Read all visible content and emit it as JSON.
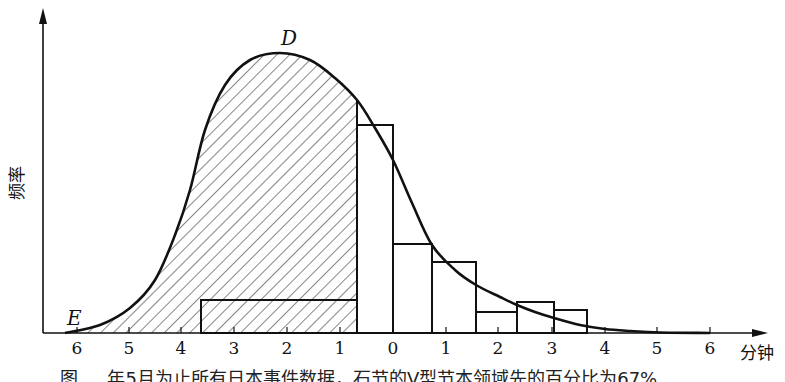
{
  "chart_data": {
    "type": "area",
    "title": "",
    "xlabel": "分钟",
    "ylabel": "频率",
    "x_tick_labels": [
      "6",
      "5",
      "4",
      "3",
      "2",
      "1",
      "0",
      "1",
      "2",
      "3",
      "4",
      "5",
      "6"
    ],
    "x_tick_px": [
      77,
      129,
      181,
      234,
      287,
      340,
      393,
      446,
      498,
      552,
      605,
      657,
      710
    ],
    "point_labels": [
      {
        "name": "D",
        "x": 288,
        "y": 46
      },
      {
        "name": "E",
        "x": 70,
        "y": 325
      }
    ],
    "curve": {
      "description": "right-skewed frequency curve, peak at D, tail to E on the left",
      "points_px": [
        [
          65,
          333
        ],
        [
          100,
          325
        ],
        [
          130,
          308
        ],
        [
          155,
          280
        ],
        [
          175,
          235
        ],
        [
          190,
          190
        ],
        [
          205,
          130
        ],
        [
          225,
          85
        ],
        [
          250,
          60
        ],
        [
          280,
          53
        ],
        [
          310,
          60
        ],
        [
          335,
          78
        ],
        [
          357,
          100
        ],
        [
          375,
          128
        ],
        [
          393,
          160
        ],
        [
          412,
          203
        ],
        [
          432,
          245
        ],
        [
          455,
          270
        ],
        [
          476,
          285
        ],
        [
          500,
          297
        ],
        [
          517,
          305
        ],
        [
          535,
          312
        ],
        [
          554,
          318
        ],
        [
          580,
          325
        ],
        [
          605,
          329
        ],
        [
          630,
          331
        ],
        [
          660,
          332.5
        ],
        [
          710,
          333
        ]
      ]
    },
    "hatched_region": {
      "x_from_px": 65,
      "x_to_px": 357,
      "pattern": "diagonal \\ lines"
    },
    "histogram_bars": [
      {
        "x0_px": 201,
        "x1_px": 357,
        "top_px": 300,
        "hatched": true
      },
      {
        "x0_px": 357,
        "x1_px": 393,
        "top_px": 125
      },
      {
        "x0_px": 393,
        "x1_px": 432,
        "top_px": 244
      },
      {
        "x0_px": 432,
        "x1_px": 476,
        "top_px": 262
      },
      {
        "x0_px": 476,
        "x1_px": 517,
        "top_px": 312
      },
      {
        "x0_px": 517,
        "x1_px": 554,
        "top_px": 302
      },
      {
        "x0_px": 554,
        "x1_px": 587,
        "top_px": 310
      }
    ],
    "axis": {
      "origin_x_px": 43,
      "baseline_y_px": 333,
      "x_end_px": 765,
      "y_top_px": 10
    },
    "grid": false,
    "legend": null
  },
  "figure": {
    "y_axis_label": "频率",
    "x_axis_unit": "分钟",
    "label_D": "D",
    "label_E": "E",
    "caption": "图 … 年5月为止所有日本事件数据，石节的V型节本领域先的百分比为67%"
  }
}
